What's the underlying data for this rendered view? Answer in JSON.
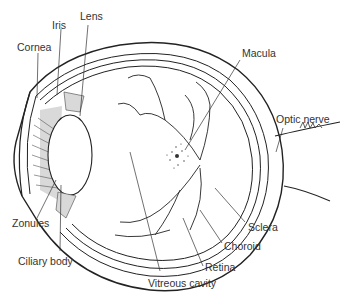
{
  "diagram": {
    "labels": {
      "cornea": "Cornea",
      "iris": "Iris",
      "lens": "Lens",
      "macula": "Macula",
      "optic_nerve": "Optic nerve",
      "sclera": "Sclera",
      "choroid": "Choroid",
      "retina": "Retina",
      "vitreous_cavity": "Vitreous cavity",
      "ciliary_body": "Ciliary body",
      "zonules": "Zonules"
    },
    "colors": {
      "line": "#222222",
      "fill": "#d9d9d9",
      "text": "#333333"
    }
  }
}
